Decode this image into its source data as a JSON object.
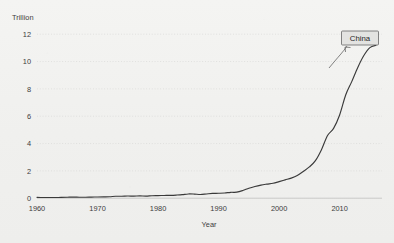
{
  "chart_data": {
    "type": "line",
    "title": "",
    "subtitle": "",
    "xlabel": "Year",
    "ylabel": "Trillion",
    "unit_label": "Trillion",
    "xlim": [
      1960,
      2017
    ],
    "ylim": [
      0,
      12
    ],
    "grid": true,
    "legend_position": "inline-callout",
    "xticks": [
      "1960",
      "1970",
      "1980",
      "1990",
      "2000",
      "2010"
    ],
    "xtick_values": [
      1960,
      1970,
      1980,
      1990,
      2000,
      2010
    ],
    "yticks": [
      "0",
      "2",
      "4",
      "6",
      "8",
      "10",
      "12"
    ],
    "ytick_values": [
      0,
      2,
      4,
      6,
      8,
      10,
      12
    ],
    "annotations": [
      {
        "label": "China",
        "x": 2016,
        "y": 11.2
      }
    ],
    "series": [
      {
        "name": "China",
        "color": "#3a3a3a",
        "x": [
          1960,
          1961,
          1962,
          1963,
          1964,
          1965,
          1966,
          1967,
          1968,
          1969,
          1970,
          1971,
          1972,
          1973,
          1974,
          1975,
          1976,
          1977,
          1978,
          1979,
          1980,
          1981,
          1982,
          1983,
          1984,
          1985,
          1986,
          1987,
          1988,
          1989,
          1990,
          1991,
          1992,
          1993,
          1994,
          1995,
          1996,
          1997,
          1998,
          1999,
          2000,
          2001,
          2002,
          2003,
          2004,
          2005,
          2006,
          2007,
          2008,
          2009,
          2010,
          2011,
          2012,
          2013,
          2014,
          2015,
          2016
        ],
        "values": [
          0.06,
          0.05,
          0.05,
          0.05,
          0.06,
          0.07,
          0.08,
          0.07,
          0.07,
          0.08,
          0.09,
          0.1,
          0.11,
          0.14,
          0.14,
          0.16,
          0.15,
          0.17,
          0.15,
          0.18,
          0.19,
          0.2,
          0.21,
          0.23,
          0.26,
          0.31,
          0.3,
          0.27,
          0.31,
          0.35,
          0.36,
          0.38,
          0.43,
          0.44,
          0.56,
          0.73,
          0.86,
          0.96,
          1.03,
          1.09,
          1.21,
          1.34,
          1.47,
          1.66,
          1.96,
          2.29,
          2.75,
          3.55,
          4.59,
          5.11,
          6.09,
          7.55,
          8.53,
          9.57,
          10.44,
          11.02,
          11.19
        ]
      }
    ]
  },
  "callout": {
    "label": "China"
  },
  "axes": {
    "y_unit": "Trillion",
    "x_title": "Year"
  }
}
